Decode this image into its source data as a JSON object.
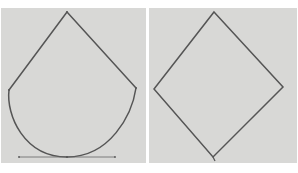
{
  "figure": {
    "background_color": "#ffffff",
    "panel_color": "#d8d8d6",
    "stroke_color": "#555555",
    "panels": [
      {
        "id": "left",
        "shape": "teardrop",
        "description": "Kite top with rounded parabolic bottom and horizontal tangent line at base",
        "vertices": {
          "top": [
            67,
            12
          ],
          "left": [
            9,
            90
          ],
          "right": [
            136,
            88
          ],
          "bottom": [
            67,
            157
          ]
        },
        "tangent_line": {
          "x1": 19,
          "x2": 115,
          "y": 157
        }
      },
      {
        "id": "right",
        "shape": "diamond",
        "description": "Rhombus / diamond outline",
        "vertices": {
          "top": [
            214,
            12
          ],
          "left": [
            154,
            89
          ],
          "right": [
            283,
            87
          ],
          "bottom": [
            213,
            157
          ]
        }
      }
    ]
  }
}
